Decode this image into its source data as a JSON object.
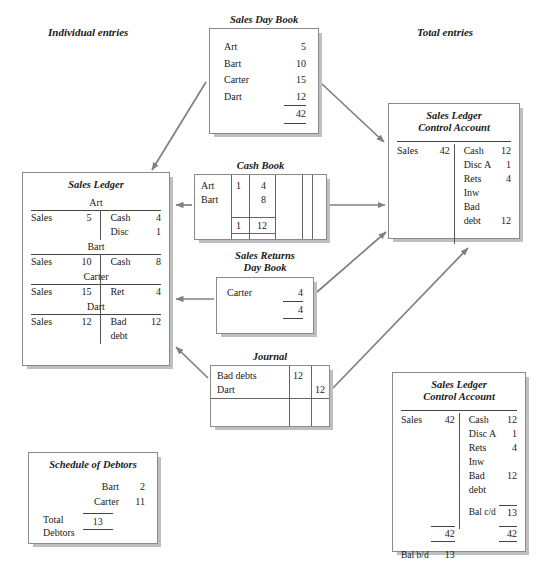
{
  "headers": {
    "left": "Individual entries",
    "right": "Total entries"
  },
  "sales_day_book": {
    "title": "Sales Day Book",
    "rows": [
      {
        "name": "Art",
        "value": "5"
      },
      {
        "name": "Bart",
        "value": "10"
      },
      {
        "name": "Carter",
        "value": "15"
      },
      {
        "name": "Dart",
        "value": "12"
      }
    ],
    "total": "42"
  },
  "sales_ledger": {
    "title": "Sales Ledger",
    "accounts": [
      {
        "name": "Art",
        "lines": [
          {
            "debit_name": "Sales",
            "debit_value": "5",
            "credit_name": "Cash",
            "credit_value": "4"
          },
          {
            "debit_name": "",
            "debit_value": "",
            "credit_name": "Disc",
            "credit_value": "1"
          }
        ]
      },
      {
        "name": "Bart",
        "lines": [
          {
            "debit_name": "Sales",
            "debit_value": "10",
            "credit_name": "Cash",
            "credit_value": "8"
          }
        ]
      },
      {
        "name": "Carter",
        "lines": [
          {
            "debit_name": "Sales",
            "debit_value": "15",
            "credit_name": "Ret",
            "credit_value": "4"
          }
        ]
      },
      {
        "name": "Dart",
        "lines": [
          {
            "debit_name": "Sales",
            "debit_value": "12",
            "credit_name": "Bad",
            "credit_value": "12"
          },
          {
            "debit_name": "",
            "debit_value": "",
            "credit_name": "debt",
            "credit_value": ""
          }
        ]
      }
    ]
  },
  "cash_book": {
    "title": "Cash Book",
    "rows": [
      {
        "name": "Art",
        "disc": "1",
        "cash": "4"
      },
      {
        "name": "Bart",
        "disc": "",
        "cash": "8"
      }
    ],
    "totals": {
      "disc": "1",
      "cash": "12"
    },
    "empty_columns": 3
  },
  "sales_returns_day_book": {
    "title_line1": "Sales Returns",
    "title_line2": "Day Book",
    "rows": [
      {
        "name": "Carter",
        "value": "4"
      }
    ],
    "total": "4"
  },
  "journal": {
    "title": "Journal",
    "rows": [
      {
        "name": "Bad debts",
        "debit": "12",
        "credit": ""
      },
      {
        "name": "Dart",
        "debit": "",
        "credit": "12"
      }
    ]
  },
  "control_account_top": {
    "title_line1": "Sales Ledger",
    "title_line2": "Control Account",
    "lines": [
      {
        "debit_name": "Sales",
        "debit_value": "42",
        "credit_name": "Cash",
        "credit_value": "12"
      },
      {
        "debit_name": "",
        "debit_value": "",
        "credit_name": "Disc A",
        "credit_value": "1"
      },
      {
        "debit_name": "",
        "debit_value": "",
        "credit_name": "Rets",
        "credit_value": "4"
      },
      {
        "debit_name": "",
        "debit_value": "",
        "credit_name": "Inw",
        "credit_value": ""
      },
      {
        "debit_name": "",
        "debit_value": "",
        "credit_name": "Bad",
        "credit_value": ""
      },
      {
        "debit_name": "",
        "debit_value": "",
        "credit_name": "debt",
        "credit_value": "12"
      }
    ]
  },
  "control_account_bottom": {
    "title_line1": "Sales Ledger",
    "title_line2": "Control Account",
    "lines": [
      {
        "debit_name": "Sales",
        "debit_value": "42",
        "credit_name": "Cash",
        "credit_value": "12"
      },
      {
        "debit_name": "",
        "debit_value": "",
        "credit_name": "Disc A",
        "credit_value": "1"
      },
      {
        "debit_name": "",
        "debit_value": "",
        "credit_name": "Rets",
        "credit_value": "4"
      },
      {
        "debit_name": "",
        "debit_value": "",
        "credit_name": "Inw",
        "credit_value": ""
      },
      {
        "debit_name": "",
        "debit_value": "",
        "credit_name": "Bad",
        "credit_value": "12"
      },
      {
        "debit_name": "",
        "debit_value": "",
        "credit_name": "debt",
        "credit_value": ""
      },
      {
        "debit_name": "",
        "debit_value": "",
        "credit_name": "Bal c/d",
        "credit_value": "13"
      }
    ],
    "totals": {
      "debit": "42",
      "credit": "42"
    },
    "balance_bd": {
      "label": "Bal b/d",
      "value": "13"
    }
  },
  "schedule_of_debtors": {
    "title": "Schedule of Debtors",
    "rows": [
      {
        "name": "Bart",
        "value": "2"
      },
      {
        "name": "Carter",
        "value": "11"
      }
    ],
    "total_label_line1": "Total",
    "total_label_line2": "Debtors",
    "total_value": "13"
  },
  "colors": {
    "arrow": "#808080",
    "border": "#8a8a8a",
    "shadow": "#bfbfbf",
    "text": "#1a1a1a"
  }
}
